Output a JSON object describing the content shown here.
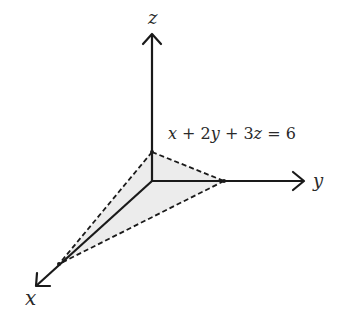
{
  "diagram": {
    "axes": {
      "x": {
        "label": "x"
      },
      "y": {
        "label": "y"
      },
      "z": {
        "label": "z"
      }
    },
    "plane": {
      "equation_parts": [
        "x",
        " + 2",
        "y",
        " + 3",
        "z",
        " = 6"
      ],
      "fill_color": "#ececec",
      "edge_style": "dashed"
    },
    "colors": {
      "axis": "#1a1a1a",
      "text": "#2a2a2a",
      "plane_fill": "#ececec"
    }
  }
}
